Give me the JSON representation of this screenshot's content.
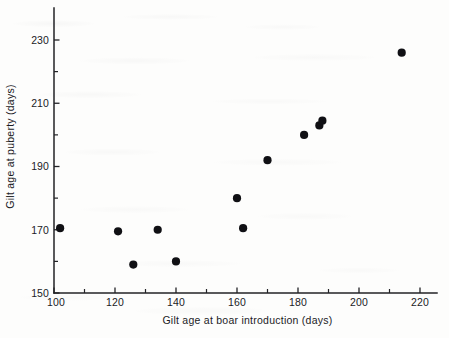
{
  "chart_data": {
    "type": "scatter",
    "title": "",
    "xlabel": "Gilt age at boar introduction (days)",
    "ylabel": "Gilt age at puberty (days)",
    "xlim": [
      100,
      222
    ],
    "ylim": [
      150,
      232
    ],
    "x_ticks": [
      100,
      120,
      140,
      160,
      180,
      200,
      220
    ],
    "x_tick_labels": [
      "100",
      "120",
      "140",
      "160",
      "180",
      "200",
      "220"
    ],
    "x_minor_ticks": [
      110,
      130,
      150,
      170,
      190,
      210
    ],
    "y_ticks": [
      150,
      170,
      190,
      210,
      230
    ],
    "y_tick_labels": [
      "150",
      "170",
      "190",
      "210",
      "230"
    ],
    "y_minor_ticks": [
      160,
      180,
      200,
      220
    ],
    "grid": false,
    "legend": "none",
    "marker": "filled-circle",
    "marker_color": "#101014",
    "marker_size": 4.1,
    "points": [
      {
        "x": 102,
        "y": 170.5
      },
      {
        "x": 121,
        "y": 169.5
      },
      {
        "x": 126,
        "y": 159.0
      },
      {
        "x": 134,
        "y": 170.0
      },
      {
        "x": 140,
        "y": 160.0
      },
      {
        "x": 160,
        "y": 180.0
      },
      {
        "x": 162,
        "y": 170.5
      },
      {
        "x": 170,
        "y": 192.0
      },
      {
        "x": 182,
        "y": 200.0
      },
      {
        "x": 187,
        "y": 203.0
      },
      {
        "x": 188,
        "y": 204.5
      },
      {
        "x": 214,
        "y": 226.0
      }
    ]
  },
  "figure": {
    "background_color": "#fdfdfc",
    "axis_color": "#222226",
    "text_color": "#1b1b1f"
  }
}
